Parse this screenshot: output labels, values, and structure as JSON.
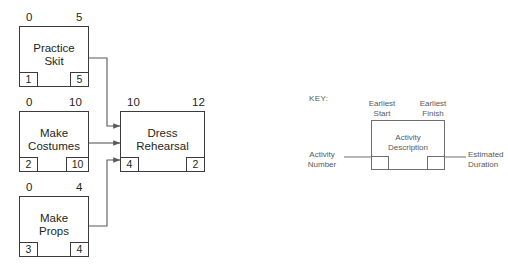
{
  "diagram": {
    "type": "activity-on-node-network",
    "nodes": [
      {
        "id": "practice-skit",
        "title_line1": "Practice",
        "title_line2": "Skit",
        "earliest_start": "0",
        "earliest_finish": "5",
        "activity_number": "1",
        "estimated_duration": "5"
      },
      {
        "id": "make-costumes",
        "title_line1": "Make",
        "title_line2": "Costumes",
        "earliest_start": "0",
        "earliest_finish": "10",
        "activity_number": "2",
        "estimated_duration": "10"
      },
      {
        "id": "make-props",
        "title_line1": "Make",
        "title_line2": "Props",
        "earliest_start": "0",
        "earliest_finish": "4",
        "activity_number": "3",
        "estimated_duration": "4"
      },
      {
        "id": "dress-rehearsal",
        "title_line1": "Dress",
        "title_line2": "Rehearsal",
        "earliest_start": "10",
        "earliest_finish": "12",
        "activity_number": "4",
        "estimated_duration": "2"
      }
    ],
    "edges": [
      {
        "from": "practice-skit",
        "to": "dress-rehearsal"
      },
      {
        "from": "make-costumes",
        "to": "dress-rehearsal"
      },
      {
        "from": "make-props",
        "to": "dress-rehearsal"
      }
    ]
  },
  "key": {
    "title": "KEY:",
    "earliest_start_l1": "Earliest",
    "earliest_start_l2": "Start",
    "earliest_finish_l1": "Earliest",
    "earliest_finish_l2": "Finish",
    "activity_description_l1": "Activity",
    "activity_description_l2": "Description",
    "activity_number_l1": "Activity",
    "activity_number_l2": "Number",
    "estimated_duration_l1": "Estimated",
    "estimated_duration_l2": "Duration"
  },
  "colors": {
    "node_stroke": "#3b3b3b",
    "key_stroke": "#6d6e71",
    "text": "#231f20",
    "key_text": "#58595b",
    "background": "#ffffff"
  }
}
